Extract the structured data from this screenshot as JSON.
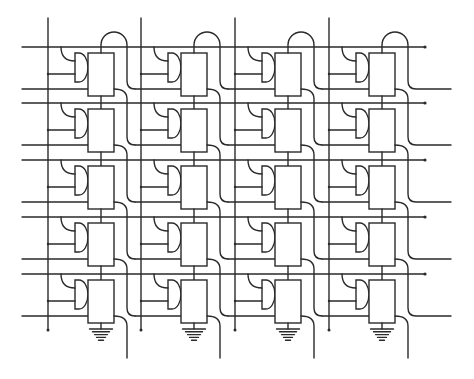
{
  "diagram": {
    "title": "Memory cell array schematic",
    "type": "circuit-schematic",
    "grid": {
      "rows": 5,
      "columns": 4
    },
    "colors": {
      "line": "#2a2a2a",
      "background": "#ffffff"
    },
    "geometry": {
      "bitline_x": [
        48,
        141,
        235,
        329
      ],
      "wordline_y": [
        47,
        103,
        160,
        217,
        274
      ],
      "wordline_x_start": 22,
      "wordline_x_end": 425,
      "bitline_y_start": 18,
      "bitline_y_end": 330,
      "output_x_end": 451,
      "exit_y_end": 358
    },
    "cell": {
      "components": [
        "gate (D-shaped)",
        "storage box",
        "feed arc",
        "output line"
      ],
      "count": 20
    },
    "ground_symbols": 4,
    "labels": []
  }
}
